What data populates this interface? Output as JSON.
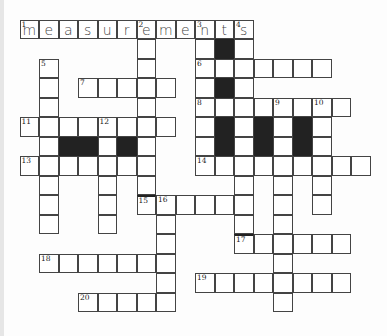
{
  "puzzle": {
    "title_word": "measurements",
    "rows": 15,
    "cols": 19,
    "colors": {
      "cell_border": "#444444",
      "black_cell": "#222222",
      "background": "#fdfdfd"
    },
    "cells": [
      {
        "r": 0,
        "c": 0,
        "n": "1",
        "l": "m"
      },
      {
        "r": 0,
        "c": 1,
        "l": "e"
      },
      {
        "r": 0,
        "c": 2,
        "l": "a"
      },
      {
        "r": 0,
        "c": 3,
        "l": "s"
      },
      {
        "r": 0,
        "c": 4,
        "l": "u"
      },
      {
        "r": 0,
        "c": 5,
        "l": "r"
      },
      {
        "r": 0,
        "c": 6,
        "n": "2",
        "l": "e"
      },
      {
        "r": 0,
        "c": 7,
        "l": "m"
      },
      {
        "r": 0,
        "c": 8,
        "l": "e"
      },
      {
        "r": 0,
        "c": 9,
        "n": "3",
        "l": "n"
      },
      {
        "r": 0,
        "c": 10,
        "l": "t"
      },
      {
        "r": 0,
        "c": 11,
        "n": "4",
        "l": "s"
      },
      {
        "r": 1,
        "c": 6
      },
      {
        "r": 1,
        "c": 9
      },
      {
        "r": 1,
        "c": 10,
        "b": true
      },
      {
        "r": 1,
        "c": 11
      },
      {
        "r": 2,
        "c": 1,
        "n": "5"
      },
      {
        "r": 2,
        "c": 6
      },
      {
        "r": 2,
        "c": 9,
        "n": "6"
      },
      {
        "r": 2,
        "c": 10
      },
      {
        "r": 2,
        "c": 11
      },
      {
        "r": 2,
        "c": 12
      },
      {
        "r": 2,
        "c": 13
      },
      {
        "r": 2,
        "c": 14
      },
      {
        "r": 2,
        "c": 15
      },
      {
        "r": 3,
        "c": 1
      },
      {
        "r": 3,
        "c": 3,
        "n": "7"
      },
      {
        "r": 3,
        "c": 4
      },
      {
        "r": 3,
        "c": 5
      },
      {
        "r": 3,
        "c": 6
      },
      {
        "r": 3,
        "c": 7
      },
      {
        "r": 3,
        "c": 9
      },
      {
        "r": 3,
        "c": 10,
        "b": true
      },
      {
        "r": 3,
        "c": 11
      },
      {
        "r": 4,
        "c": 1
      },
      {
        "r": 4,
        "c": 6
      },
      {
        "r": 4,
        "c": 9,
        "n": "8"
      },
      {
        "r": 4,
        "c": 10
      },
      {
        "r": 4,
        "c": 11
      },
      {
        "r": 4,
        "c": 12
      },
      {
        "r": 4,
        "c": 13,
        "n": "9"
      },
      {
        "r": 4,
        "c": 14
      },
      {
        "r": 4,
        "c": 15,
        "n": "10"
      },
      {
        "r": 4,
        "c": 16
      },
      {
        "r": 5,
        "c": 0,
        "n": "11"
      },
      {
        "r": 5,
        "c": 1
      },
      {
        "r": 5,
        "c": 2
      },
      {
        "r": 5,
        "c": 3
      },
      {
        "r": 5,
        "c": 4,
        "n": "12"
      },
      {
        "r": 5,
        "c": 5
      },
      {
        "r": 5,
        "c": 6
      },
      {
        "r": 5,
        "c": 7
      },
      {
        "r": 5,
        "c": 9
      },
      {
        "r": 5,
        "c": 10,
        "b": true
      },
      {
        "r": 5,
        "c": 11
      },
      {
        "r": 5,
        "c": 12,
        "b": true
      },
      {
        "r": 5,
        "c": 13
      },
      {
        "r": 5,
        "c": 14,
        "b": true
      },
      {
        "r": 5,
        "c": 15
      },
      {
        "r": 6,
        "c": 1
      },
      {
        "r": 6,
        "c": 2,
        "b": true
      },
      {
        "r": 6,
        "c": 3,
        "b": true
      },
      {
        "r": 6,
        "c": 4
      },
      {
        "r": 6,
        "c": 5,
        "b": true
      },
      {
        "r": 6,
        "c": 6
      },
      {
        "r": 6,
        "c": 9
      },
      {
        "r": 6,
        "c": 10,
        "b": true
      },
      {
        "r": 6,
        "c": 11
      },
      {
        "r": 6,
        "c": 12,
        "b": true
      },
      {
        "r": 6,
        "c": 13
      },
      {
        "r": 6,
        "c": 14,
        "b": true
      },
      {
        "r": 6,
        "c": 15
      },
      {
        "r": 7,
        "c": 0,
        "n": "13"
      },
      {
        "r": 7,
        "c": 1
      },
      {
        "r": 7,
        "c": 2
      },
      {
        "r": 7,
        "c": 3
      },
      {
        "r": 7,
        "c": 4
      },
      {
        "r": 7,
        "c": 5
      },
      {
        "r": 7,
        "c": 6
      },
      {
        "r": 7,
        "c": 9,
        "n": "14"
      },
      {
        "r": 7,
        "c": 10
      },
      {
        "r": 7,
        "c": 11
      },
      {
        "r": 7,
        "c": 12
      },
      {
        "r": 7,
        "c": 13
      },
      {
        "r": 7,
        "c": 14
      },
      {
        "r": 7,
        "c": 15
      },
      {
        "r": 7,
        "c": 16
      },
      {
        "r": 7,
        "c": 17
      },
      {
        "r": 8,
        "c": 1
      },
      {
        "r": 8,
        "c": 4
      },
      {
        "r": 8,
        "c": 6
      },
      {
        "r": 8,
        "c": 11
      },
      {
        "r": 8,
        "c": 13
      },
      {
        "r": 8,
        "c": 15
      },
      {
        "r": 9,
        "c": 1
      },
      {
        "r": 9,
        "c": 4
      },
      {
        "r": 9,
        "c": 6,
        "n": "15",
        "bar": true
      },
      {
        "r": 9,
        "c": 7,
        "n": "16"
      },
      {
        "r": 9,
        "c": 8
      },
      {
        "r": 9,
        "c": 9
      },
      {
        "r": 9,
        "c": 10
      },
      {
        "r": 9,
        "c": 11
      },
      {
        "r": 9,
        "c": 13
      },
      {
        "r": 9,
        "c": 15
      },
      {
        "r": 10,
        "c": 1
      },
      {
        "r": 10,
        "c": 4
      },
      {
        "r": 10,
        "c": 7
      },
      {
        "r": 10,
        "c": 11
      },
      {
        "r": 10,
        "c": 13
      },
      {
        "r": 11,
        "c": 7
      },
      {
        "r": 11,
        "c": 11,
        "n": "17",
        "bar": true
      },
      {
        "r": 11,
        "c": 12
      },
      {
        "r": 11,
        "c": 13
      },
      {
        "r": 11,
        "c": 14
      },
      {
        "r": 11,
        "c": 15
      },
      {
        "r": 11,
        "c": 16
      },
      {
        "r": 12,
        "c": 1,
        "n": "18"
      },
      {
        "r": 12,
        "c": 2
      },
      {
        "r": 12,
        "c": 3
      },
      {
        "r": 12,
        "c": 4
      },
      {
        "r": 12,
        "c": 5
      },
      {
        "r": 12,
        "c": 6
      },
      {
        "r": 12,
        "c": 7
      },
      {
        "r": 12,
        "c": 13
      },
      {
        "r": 13,
        "c": 7
      },
      {
        "r": 13,
        "c": 9,
        "n": "19"
      },
      {
        "r": 13,
        "c": 10
      },
      {
        "r": 13,
        "c": 11
      },
      {
        "r": 13,
        "c": 12
      },
      {
        "r": 13,
        "c": 13
      },
      {
        "r": 13,
        "c": 14
      },
      {
        "r": 13,
        "c": 15
      },
      {
        "r": 13,
        "c": 16
      },
      {
        "r": 14,
        "c": 3,
        "n": "20"
      },
      {
        "r": 14,
        "c": 4
      },
      {
        "r": 14,
        "c": 5
      },
      {
        "r": 14,
        "c": 6
      },
      {
        "r": 14,
        "c": 7
      },
      {
        "r": 14,
        "c": 13
      }
    ]
  }
}
